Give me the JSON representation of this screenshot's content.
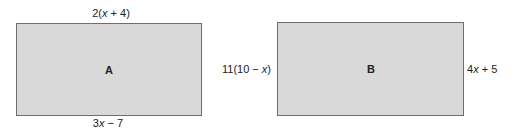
{
  "figure": {
    "rectangles": [
      {
        "id": "A",
        "label": "A",
        "top_label": "2(x + 4)",
        "bottom_label": "3x − 7",
        "fill": "#d9d9d9",
        "border": "#6e6e6e"
      },
      {
        "id": "B",
        "label": "B",
        "left_label": "11(10 − x)",
        "right_label": "4x + 5",
        "fill": "#d9d9d9",
        "border": "#6e6e6e"
      }
    ]
  }
}
